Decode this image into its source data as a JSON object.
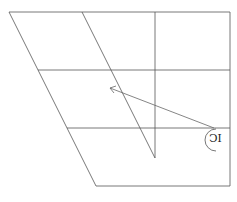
{
  "diagram": {
    "label": "IC",
    "stroke_color": "#555555",
    "arrow_color": "#666666"
  }
}
